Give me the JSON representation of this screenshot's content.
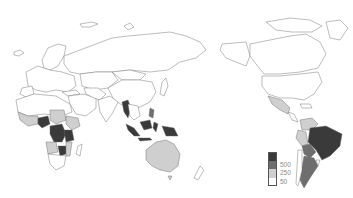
{
  "map": {
    "type": "choropleth",
    "projection": "pacific-centered-world",
    "palette": {
      "none": "#ffffff",
      "low": "#cfcfcf",
      "mid": "#6e6e6e",
      "high": "#3a3a3a",
      "border": "#6b6b6b"
    }
  },
  "legend": {
    "items": [
      {
        "label": "",
        "color": "#3a3a3a"
      },
      {
        "label": "500",
        "color": "#6e6e6e"
      },
      {
        "label": "250",
        "color": "#cfcfcf"
      },
      {
        "label": "50",
        "color": "#ffffff"
      }
    ]
  }
}
